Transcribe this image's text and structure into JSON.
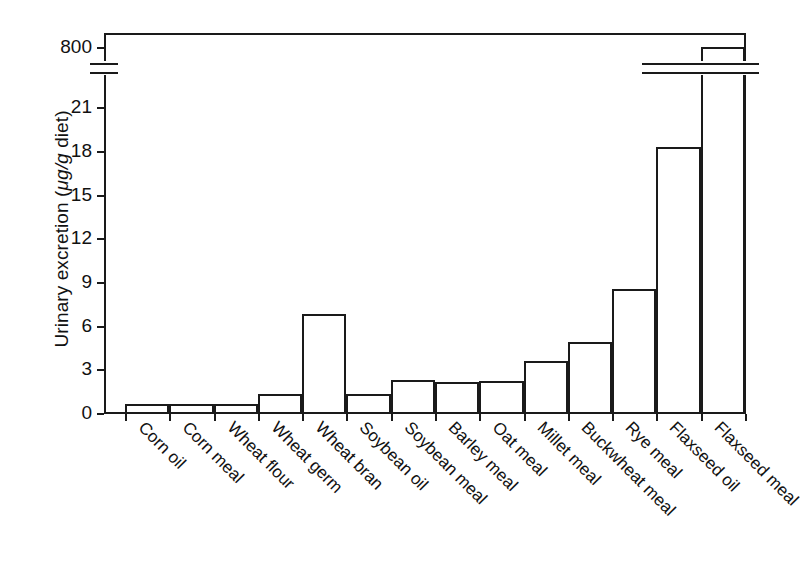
{
  "chart_data": {
    "type": "bar",
    "title": "",
    "xlabel": "",
    "ylabel": "Urinary excretion (μg/g diet)",
    "ylabel_plain": "Urinary excretion (",
    "ylabel_italic": "μg/g",
    "ylabel_tail": " diet)",
    "categories": [
      "Corn oil",
      "Corn meal",
      "Wheat flour",
      "Wheat germ",
      "Wheat bran",
      "Soybean oil",
      "Soybean meal",
      "Barley meal",
      "Oat meal",
      "Millet meal",
      "Buckwheat meal",
      "Rye meal",
      "Flaxseed oil",
      "Flaxseed meal"
    ],
    "values": [
      0.6,
      0.6,
      0.6,
      1.3,
      6.8,
      1.3,
      2.3,
      2.1,
      2.2,
      3.6,
      4.9,
      8.5,
      18.3,
      800
    ],
    "ytick_labels": [
      "0",
      "3",
      "6",
      "9",
      "12",
      "15",
      "18",
      "21",
      "800"
    ],
    "ytick_values": [
      0,
      3,
      6,
      9,
      12,
      15,
      18,
      21,
      800
    ],
    "ylim": [
      0,
      22
    ],
    "axis_break": true,
    "axis_break_note": "y-axis broken between 21 and 800",
    "grid": false,
    "legend": "none",
    "bar_facecolor": "#ffffff",
    "bar_edgecolor": "#1a1a1a",
    "background": "#ffffff"
  }
}
